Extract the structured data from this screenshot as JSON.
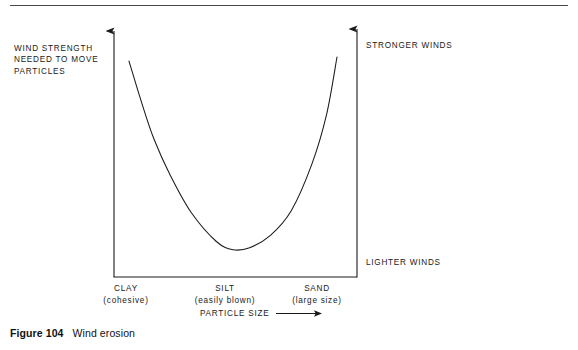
{
  "figure": {
    "number": "Figure 104",
    "title": "Wind erosion"
  },
  "axes": {
    "y_left_label": "WIND STRENGTH\nNEEDED TO MOVE\nPARTICLES",
    "y_right_top_label": "STRONGER WINDS",
    "y_right_bottom_label": "LIGHTER WINDS",
    "x_title": "PARTICLE SIZE",
    "x_arrow": "⟶"
  },
  "chart_data": {
    "type": "line",
    "title": "Wind erosion",
    "xlabel": "PARTICLE SIZE",
    "ylabel": "WIND STRENGTH NEEDED TO MOVE PARTICLES",
    "grid": false,
    "legend": null,
    "categories": [
      "CLAY",
      "SILT",
      "SAND"
    ],
    "category_descriptions": [
      "(cohesive)",
      "(easily blown)",
      "(large size)"
    ],
    "y_annotations": [
      "STRONGER WINDS",
      "LIGHTER WINDS"
    ],
    "x": [
      0,
      0.06,
      0.12,
      0.2,
      0.3,
      0.42,
      0.5,
      0.58,
      0.68,
      0.78,
      0.88,
      0.95,
      1.0
    ],
    "y": [
      0.98,
      0.78,
      0.6,
      0.42,
      0.24,
      0.1,
      0.06,
      0.07,
      0.13,
      0.25,
      0.48,
      0.72,
      1.0
    ],
    "xlim": [
      0,
      1
    ],
    "ylim": [
      0,
      1
    ],
    "note": "U-shaped curve: wind strength is highest for clay and sand, lowest for silt"
  },
  "curve_path": "M 129 57 C 135 120, 150 215, 180 247 C 200 266, 252 268, 280 250 C 305 233, 325 140, 337 50",
  "colors": {
    "line": "#1a1a1a",
    "text": "#1a1a1a",
    "rule": "#4a4a4a",
    "background": "#ffffff"
  }
}
